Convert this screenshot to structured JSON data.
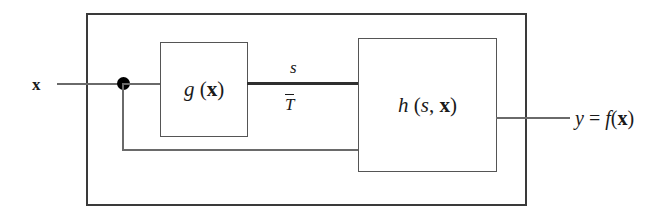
{
  "diagram": {
    "outer_frame": {
      "name": "system-boundary"
    },
    "input": {
      "label_var": "x",
      "label_plain": "x"
    },
    "junction": {
      "name": "branch-node"
    },
    "blocks": [
      {
        "id": "g-block",
        "func": "g",
        "open_paren": "(",
        "arg": "x",
        "close_paren": ")",
        "text_plain": "g (x)"
      },
      {
        "id": "h-block",
        "func": "h",
        "open_paren": "(",
        "arg1": "s",
        "comma": ", ",
        "arg2": "x",
        "close_paren": ")",
        "text_plain": "h (s, x)"
      }
    ],
    "signals": {
      "forward_label": "s",
      "forward_label_plain": "s",
      "threshold_label": "T",
      "threshold_label_plain": "T̄",
      "feedback_name": "feedback-path-x"
    },
    "output": {
      "var": "y",
      "equals": " = ",
      "func": "f",
      "open_paren": "(",
      "arg": "x",
      "close_paren": ")",
      "text_plain": "y = f(x)"
    },
    "colors": {
      "frame": "#3a3a3a",
      "block_border": "#555555",
      "wire": "#6a6a6a",
      "wire_thick": "#2f2f2f",
      "node": "#000000",
      "text": "#1a1a1a",
      "background": "#ffffff"
    }
  }
}
